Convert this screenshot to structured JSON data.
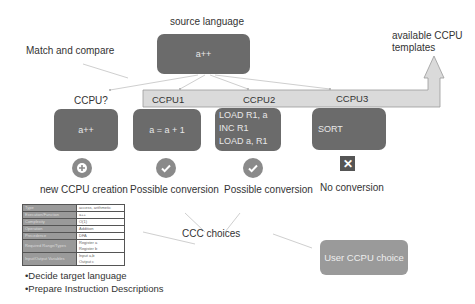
{
  "title": "source language",
  "source_box": {
    "code": "a++"
  },
  "match_label": "Match and compare",
  "templates_label": "available CCPU\ntemplates",
  "templates_label_line1": "available CCPU",
  "templates_label_line2": "templates",
  "candidates": [
    {
      "header": "CCPU?",
      "code_lines": [
        "a++"
      ],
      "status_icon": "plus-circle-icon",
      "status_label": "new CCPU creation"
    },
    {
      "header": "CCPU1",
      "code_lines": [
        "a = a + 1"
      ],
      "status_icon": "check-circle-icon",
      "status_label": "Possible conversion"
    },
    {
      "header": "CCPU2",
      "code_lines": [
        "LOAD R1, a",
        "INC R1",
        "LOAD a, R1"
      ],
      "status_icon": "check-circle-icon",
      "status_label": "Possible conversion"
    },
    {
      "header": "CCPU3",
      "code_lines": [
        "SORT"
      ],
      "status_icon": "x-box-icon",
      "status_label": "No conversion"
    }
  ],
  "ccc_label": "CCC choices",
  "user_choice": "User CCPU choice",
  "description_table": {
    "rows": [
      {
        "key": "Type",
        "value": "access, arithmetic"
      },
      {
        "key": "Execution/Function",
        "value": "a++"
      },
      {
        "key": "Complexity",
        "value": "O(1)"
      },
      {
        "key": "Operation",
        "value": "Addition"
      },
      {
        "key": "Precedence",
        "value": "DFA"
      },
      {
        "key": "Required Range/Types",
        "value": "Register a\nRegister b"
      },
      {
        "key": "Input/Output Variables",
        "value": "Input a,b\nOutput c"
      }
    ]
  },
  "bullets": [
    "•Decide target language",
    "•Prepare Instruction Descriptions"
  ],
  "colors": {
    "box_dark": "#6b6b6b",
    "box_light": "#9a9a9a",
    "band": "#d9d9d9",
    "arrow": "#c8c8c8"
  }
}
